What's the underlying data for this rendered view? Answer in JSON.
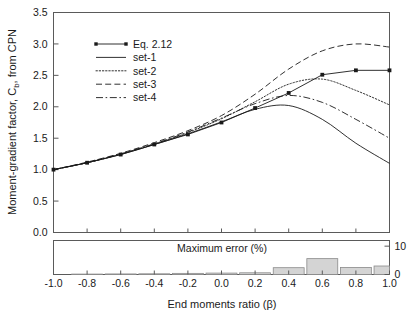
{
  "figure": {
    "background": "#ffffff",
    "ink": "#1a1a1a",
    "bar_fill": "#d4d4d4",
    "bar_stroke": "#8a8a8a"
  },
  "top_panel": {
    "y_axis_title_part1": "Moment-gradient factor, C",
    "y_axis_title_sub": "b",
    "y_axis_title_part2": ", from CPN",
    "y_ticks": [
      "0.0",
      "0.5",
      "1.0",
      "1.5",
      "2.0",
      "2.5",
      "3.0",
      "3.5"
    ],
    "y_min": 0.0,
    "y_max": 3.5
  },
  "bottom_panel": {
    "label": "Maximum error (%)",
    "right_ticks": [
      "0",
      "10"
    ],
    "y_min": 0,
    "y_max": 12
  },
  "x_axis": {
    "title": "End moments ratio (β)",
    "ticks": [
      "-1.0",
      "-0.8",
      "-0.6",
      "-0.4",
      "-0.2",
      "0.0",
      "0.2",
      "0.4",
      "0.6",
      "0.8",
      "1.0"
    ],
    "x_min": -1.0,
    "x_max": 1.0
  },
  "legend": {
    "entries": [
      {
        "label": "Eq. 2.12",
        "style": "solid-marker"
      },
      {
        "label": "set-1",
        "style": "solid"
      },
      {
        "label": "set-2",
        "style": "dotted"
      },
      {
        "label": "set-3",
        "style": "dashed"
      },
      {
        "label": "set-4",
        "style": "dashdot"
      }
    ]
  },
  "chart_data": [
    {
      "type": "line",
      "title": "",
      "xlabel": "End moments ratio (β)",
      "ylabel": "Moment-gradient factor, Cb, from CPN",
      "xlim": [
        -1.0,
        1.0
      ],
      "ylim": [
        0.0,
        3.5
      ],
      "grid": false,
      "legend_position": "upper-left-inside",
      "x": [
        -1.0,
        -0.8,
        -0.6,
        -0.4,
        -0.2,
        0.0,
        0.2,
        0.4,
        0.6,
        0.8,
        1.0
      ],
      "series": [
        {
          "name": "Eq. 2.12",
          "style": "solid-marker",
          "marker": "square",
          "values": [
            1.0,
            1.11,
            1.24,
            1.4,
            1.56,
            1.75,
            1.98,
            2.22,
            2.51,
            2.58,
            2.58
          ]
        },
        {
          "name": "set-1",
          "style": "solid",
          "values": [
            1.0,
            1.11,
            1.24,
            1.4,
            1.57,
            1.76,
            1.96,
            2.02,
            1.8,
            1.42,
            1.1
          ]
        },
        {
          "name": "set-2",
          "style": "dotted",
          "values": [
            1.0,
            1.11,
            1.25,
            1.41,
            1.59,
            1.81,
            2.08,
            2.36,
            2.44,
            2.26,
            2.03
          ]
        },
        {
          "name": "set-3",
          "style": "dashed",
          "values": [
            1.0,
            1.12,
            1.26,
            1.43,
            1.62,
            1.86,
            2.2,
            2.6,
            2.89,
            3.0,
            2.95
          ]
        },
        {
          "name": "set-4",
          "style": "dashdot",
          "values": [
            1.0,
            1.11,
            1.25,
            1.41,
            1.6,
            1.82,
            2.05,
            2.18,
            2.07,
            1.8,
            1.5
          ]
        }
      ]
    },
    {
      "type": "bar",
      "title": "Maximum error (%)",
      "xlabel": "End moments ratio (β)",
      "ylabel": "Maximum error (%)",
      "ylim": [
        0,
        12
      ],
      "grid": false,
      "categories": [
        "-1.0",
        "-0.8",
        "-0.6",
        "-0.4",
        "-0.2",
        "0.0",
        "0.2",
        "0.4",
        "0.6",
        "0.8",
        "1.0"
      ],
      "values": [
        0.0,
        0.15,
        0.2,
        0.25,
        0.4,
        0.5,
        0.6,
        2.4,
        5.6,
        2.5,
        3.0
      ]
    }
  ]
}
